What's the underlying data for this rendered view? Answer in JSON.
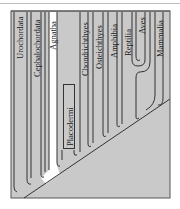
{
  "figure": {
    "type": "cladogram",
    "background_color": "#c9c9c9",
    "highlight_color": "#ffffff",
    "line_color": "#333333"
  },
  "taxa": [
    {
      "label": "Urochordata"
    },
    {
      "label": "Cephalochordata"
    },
    {
      "label": "Agnatha",
      "highlighted": true
    },
    {
      "label": "Placodermi",
      "extinct_boxed": true
    },
    {
      "label": "Chondrichthyes"
    },
    {
      "label": "Osteichthyes"
    },
    {
      "label": "Amphibia"
    },
    {
      "label": "Reptilia"
    },
    {
      "label": "Aves"
    },
    {
      "label": "Mammalia"
    }
  ]
}
